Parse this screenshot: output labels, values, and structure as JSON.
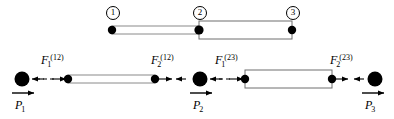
{
  "figure": {
    "colors": {
      "stroke": "#000000",
      "bar_fill": "#ffffff",
      "bar_edge": "#808080",
      "background": "#ffffff"
    }
  },
  "assembly": {
    "nodes": [
      {
        "id": "node-1",
        "label": "1",
        "x": 112,
        "y": 30
      },
      {
        "id": "node-2",
        "label": "2",
        "x": 199,
        "y": 30
      },
      {
        "id": "node-3",
        "label": "3",
        "x": 292,
        "y": 30
      }
    ],
    "elements": [
      {
        "id": "element-12",
        "label": "(12)",
        "x1": 112,
        "x2": 199,
        "half_height": 4
      },
      {
        "id": "element-23",
        "label": "(23)",
        "x1": 199,
        "x2": 292,
        "half_height": 9
      }
    ]
  },
  "freebody": {
    "baseline_y": 79,
    "nodes": [
      {
        "id": "fb-node-1",
        "x": 22,
        "load": "P",
        "load_sub": "1"
      },
      {
        "id": "fb-node-2",
        "x": 200,
        "load": "P",
        "load_sub": "2"
      },
      {
        "id": "fb-node-3",
        "x": 375,
        "load": "P",
        "load_sub": "3"
      }
    ],
    "elements": [
      {
        "id": "fb-element-12",
        "x1": 68,
        "x2": 155,
        "half_height": 4,
        "left_force": {
          "base": "F",
          "sub": "1",
          "sup": "(12)"
        },
        "right_force": {
          "base": "F",
          "sub": "2",
          "sup": "(12)"
        }
      },
      {
        "id": "fb-element-23",
        "x1": 245,
        "x2": 332,
        "half_height": 9,
        "left_force": {
          "base": "F",
          "sub": "1",
          "sup": "(23)"
        },
        "right_force": {
          "base": "F",
          "sub": "2",
          "sup": "(23)"
        }
      }
    ],
    "force_labels": [
      {
        "id": "force-F1-12",
        "base": "F",
        "sub": "1",
        "sup": "(12)",
        "x": 41,
        "y": 55
      },
      {
        "id": "force-F2-12",
        "base": "F",
        "sub": "2",
        "sup": "(12)",
        "x": 152,
        "y": 55
      },
      {
        "id": "force-F1-23",
        "base": "F",
        "sub": "1",
        "sup": "(23)",
        "x": 215,
        "y": 55
      },
      {
        "id": "force-F2-23",
        "base": "F",
        "sub": "2",
        "sup": "(23)",
        "x": 331,
        "y": 55
      }
    ],
    "load_labels": [
      {
        "id": "load-P1",
        "base": "P",
        "sub": "1",
        "x": 16,
        "y": 101,
        "arrow_x": 15,
        "arrow_y": 93
      },
      {
        "id": "load-P2",
        "base": "P",
        "sub": "2",
        "x": 194,
        "y": 101,
        "arrow_x": 193,
        "arrow_y": 93
      },
      {
        "id": "load-P3",
        "base": "P",
        "sub": "3",
        "x": 366,
        "y": 101,
        "arrow_x": 365,
        "arrow_y": 93
      }
    ]
  }
}
